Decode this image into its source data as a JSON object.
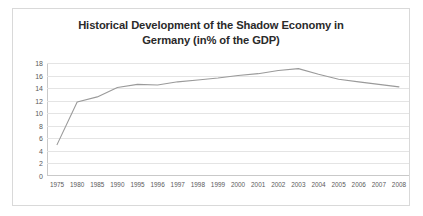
{
  "chart_data": {
    "type": "line",
    "title": "Historical Development of the Shadow Economy in Germany (in% of the GDP)",
    "title_lines": [
      "Historical Development of the Shadow Economy in",
      "Germany (in% of the GDP)"
    ],
    "xlabel": "",
    "ylabel": "",
    "categories": [
      "1975",
      "1980",
      "1985",
      "1990",
      "1995",
      "1996",
      "1997",
      "1998",
      "1999",
      "2000",
      "2001",
      "2002",
      "2003",
      "2004",
      "2005",
      "2006",
      "2007",
      "2008"
    ],
    "values": [
      5.0,
      11.8,
      12.6,
      14.1,
      14.6,
      14.5,
      15.0,
      15.3,
      15.6,
      16.0,
      16.3,
      16.8,
      17.1,
      16.2,
      15.4,
      15.0,
      14.6,
      14.2
    ],
    "series": [
      {
        "name": "Shadow Economy (% of GDP)",
        "values": [
          5.0,
          11.8,
          12.6,
          14.1,
          14.6,
          14.5,
          15.0,
          15.3,
          15.6,
          16.0,
          16.3,
          16.8,
          17.1,
          16.2,
          15.4,
          15.0,
          14.6,
          14.2
        ]
      }
    ],
    "ylim": [
      0,
      18
    ],
    "yticks": [
      0,
      2,
      4,
      6,
      8,
      10,
      12,
      14,
      16,
      18
    ],
    "ytick_labels": [
      "0",
      "2",
      "4",
      "6",
      "8",
      "10",
      "12",
      "14",
      "16",
      "18"
    ],
    "grid": true,
    "grid_axis": "y",
    "legend": false,
    "legend_position": "none",
    "line_color": "#9a9a9a",
    "grid_color": "#e4e4e4",
    "axis_color": "#c9c9c9",
    "text_color": "#5a5a5a",
    "title_color": "#2a2a2a",
    "background": "#ffffff",
    "border_color": "#d9d9d9"
  }
}
